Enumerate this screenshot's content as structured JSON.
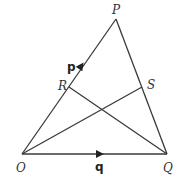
{
  "diagram": {
    "type": "geometry-triangle",
    "points": {
      "O": {
        "label": "O",
        "x": 22,
        "y": 154
      },
      "P": {
        "label": "P",
        "x": 116,
        "y": 19
      },
      "Q": {
        "label": "Q",
        "x": 167,
        "y": 154
      },
      "R": {
        "label": "R",
        "x": 69,
        "y": 87
      },
      "S": {
        "label": "S",
        "x": 142,
        "y": 87
      }
    },
    "segments": [
      {
        "from": "O",
        "to": "P"
      },
      {
        "from": "P",
        "to": "Q"
      },
      {
        "from": "O",
        "to": "Q"
      },
      {
        "from": "R",
        "to": "Q"
      },
      {
        "from": "O",
        "to": "S"
      }
    ],
    "vectors": {
      "p": {
        "label": "p",
        "along": "OP"
      },
      "q": {
        "label": "q",
        "along": "OQ"
      }
    },
    "colors": {
      "stroke": "#3a3a3a",
      "background": "#ffffff"
    }
  }
}
